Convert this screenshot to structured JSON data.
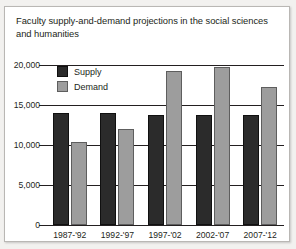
{
  "figure": {
    "title": "Faculty supply-and-demand projections in the social sciences and humanities"
  },
  "legend": {
    "position": "inside-top-left",
    "items": [
      {
        "label": "Supply",
        "color": "#2b2b2b",
        "icon": "legend-swatch-supply"
      },
      {
        "label": "Demand",
        "color": "#9d9d9d",
        "icon": "legend-swatch-demand"
      }
    ]
  },
  "axes": {
    "y_ticks": [
      "20,000",
      "15,000",
      "10,000",
      "5,000",
      "0"
    ],
    "y_tick_values": [
      20000,
      15000,
      10000,
      5000,
      0
    ],
    "x_ticks": [
      "1987-'92",
      "1992-'97",
      "1997-'02",
      "2002-'07",
      "2007-'12"
    ]
  },
  "chart_data": {
    "type": "bar",
    "title": "Faculty supply-and-demand projections in the social sciences and humanities",
    "xlabel": "",
    "ylabel": "",
    "categories": [
      "1987-'92",
      "1992-'97",
      "1997-'02",
      "2002-'07",
      "2007-'12"
    ],
    "series": [
      {
        "name": "Supply",
        "color": "#2b2b2b",
        "values": [
          14000,
          14000,
          13800,
          13800,
          13800
        ]
      },
      {
        "name": "Demand",
        "color": "#9d9d9d",
        "values": [
          10400,
          12000,
          19300,
          19800,
          17300
        ]
      }
    ],
    "ylim": [
      0,
      20000
    ],
    "ytick_step": 5000,
    "grid": true,
    "legend_position": "inside-top-left"
  }
}
